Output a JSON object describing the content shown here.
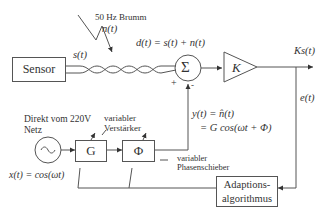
{
  "diagram": {
    "blocks": {
      "sensor": "Sensor",
      "summer": "Σ",
      "amplifier_K": "K",
      "gain_G": "G",
      "phase_Phi": "Φ",
      "adaption": [
        "Adaptions-",
        "algorithmus"
      ],
      "source": "~"
    },
    "labels": {
      "noise_title": "50 Hz Brumm",
      "noise_signal": "n(t)",
      "sensor_signal": "s(t)",
      "disturbed_signal": "d(t) = s(t) + n(t)",
      "output_signal": "Ks(t)",
      "error_signal": "e(t)",
      "estimate_line1": "y(t) = n̂(t)",
      "estimate_line2": "= G cos(ωt + Φ)",
      "source_desc_line1": "Direkt vom 220V",
      "source_desc_line2": "Netz",
      "reference_signal": "x(t) = cos(ωt)",
      "var_amp_line1": "variabler",
      "var_amp_line2": "Verstärker",
      "var_phase_line1": "variabler",
      "var_phase_line2": "Phasenschieber",
      "plus_sign": "+",
      "minus_sign": "-"
    },
    "colors": {
      "line": "#555555",
      "text": "#333333",
      "background": "#ffffff"
    }
  }
}
